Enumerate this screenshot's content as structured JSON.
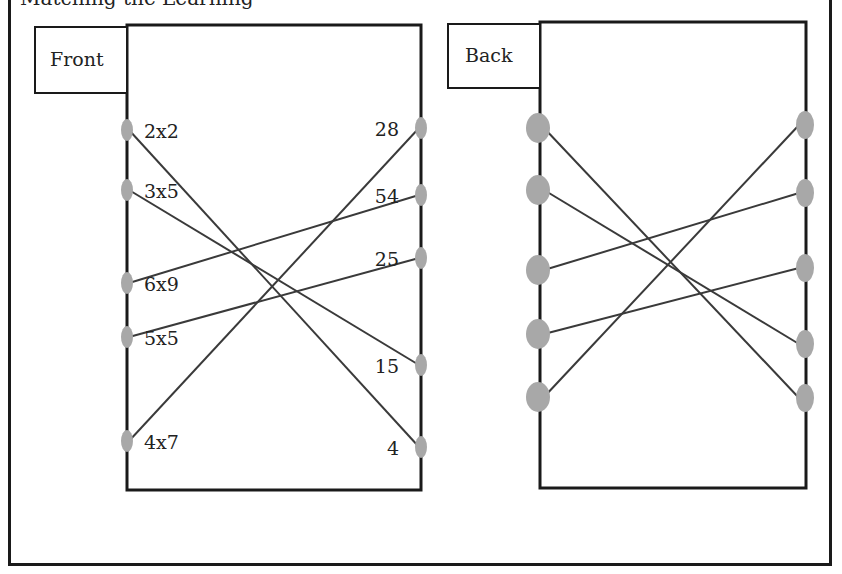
{
  "caption": "Matching the Learning",
  "colors": {
    "border": "#1a1a1a",
    "line": "#3a3a3a",
    "dot": "#a8a8a8",
    "background": "#ffffff"
  },
  "front": {
    "label": "Front",
    "label_box": {
      "x": 35,
      "y": 27,
      "w": 92,
      "h": 66
    },
    "panel": {
      "x": 127,
      "y": 25,
      "w": 294,
      "h": 465
    },
    "left_items": [
      {
        "text": "2x2",
        "y": 130
      },
      {
        "text": "3x5",
        "y": 190
      },
      {
        "text": "6x9",
        "y": 283
      },
      {
        "text": "5x5",
        "y": 337
      },
      {
        "text": "4x7",
        "y": 441
      }
    ],
    "right_items": [
      {
        "text": "28",
        "y": 128
      },
      {
        "text": "54",
        "y": 195
      },
      {
        "text": "25",
        "y": 258
      },
      {
        "text": "15",
        "y": 365
      },
      {
        "text": "4",
        "y": 447
      }
    ],
    "connections": [
      {
        "from": "2x2",
        "to": "4"
      },
      {
        "from": "3x5",
        "to": "15"
      },
      {
        "from": "6x9",
        "to": "54"
      },
      {
        "from": "5x5",
        "to": "25"
      },
      {
        "from": "4x7",
        "to": "28"
      }
    ]
  },
  "back": {
    "label": "Back",
    "label_box": {
      "x": 448,
      "y": 24,
      "w": 92,
      "h": 64
    },
    "panel": {
      "x": 540,
      "y": 22,
      "w": 266,
      "h": 466
    },
    "left_dots": [
      128,
      190,
      270,
      334,
      397
    ],
    "right_dots": [
      125,
      193,
      268,
      344,
      398
    ],
    "connections": [
      {
        "from": 0,
        "to": 4
      },
      {
        "from": 1,
        "to": 3
      },
      {
        "from": 2,
        "to": 1
      },
      {
        "from": 3,
        "to": 2
      },
      {
        "from": 4,
        "to": 0
      }
    ]
  }
}
